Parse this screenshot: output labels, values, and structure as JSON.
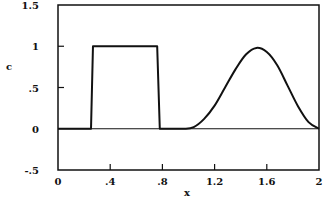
{
  "chart_data": {
    "type": "line",
    "title": "",
    "xlabel": "x",
    "ylabel": "c",
    "xlim": [
      0,
      2
    ],
    "ylim": [
      -0.5,
      1.5
    ],
    "grid": false,
    "legend": null,
    "x_ticks": [
      {
        "value": 0,
        "label": "0"
      },
      {
        "value": 0.4,
        "label": ".4"
      },
      {
        "value": 0.8,
        "label": ".8"
      },
      {
        "value": 1.2,
        "label": "1.2"
      },
      {
        "value": 1.6,
        "label": "1.6"
      },
      {
        "value": 2,
        "label": "2"
      }
    ],
    "y_ticks": [
      {
        "value": -0.5,
        "label": "-.5"
      },
      {
        "value": 0,
        "label": "0"
      },
      {
        "value": 0.5,
        "label": ".5"
      },
      {
        "value": 1,
        "label": "1"
      },
      {
        "value": 1.5,
        "label": "1.5"
      }
    ],
    "series": [
      {
        "name": "c(x)",
        "color": "#111111",
        "points": [
          [
            0,
            0
          ],
          [
            0.253,
            0
          ],
          [
            0.268,
            1
          ],
          [
            0.76,
            1
          ],
          [
            0.78,
            0
          ],
          [
            0.96,
            0
          ],
          [
            1.04,
            0.02
          ],
          [
            1.12,
            0.12
          ],
          [
            1.2,
            0.28
          ],
          [
            1.28,
            0.5
          ],
          [
            1.36,
            0.72
          ],
          [
            1.44,
            0.9
          ],
          [
            1.52,
            0.98
          ],
          [
            1.6,
            0.93
          ],
          [
            1.68,
            0.77
          ],
          [
            1.76,
            0.52
          ],
          [
            1.84,
            0.27
          ],
          [
            1.92,
            0.08
          ],
          [
            2.0,
            0
          ]
        ]
      }
    ],
    "zero_line": true
  }
}
